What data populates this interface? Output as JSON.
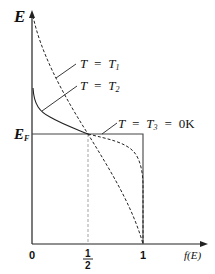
{
  "diagram": {
    "y_axis": {
      "label": "E",
      "fermi_level_label": "E",
      "fermi_level_subscript": "F"
    },
    "x_axis": {
      "label": "f(E)",
      "ticks": [
        {
          "label": "0"
        },
        {
          "numerator": "1",
          "denominator": "2"
        },
        {
          "label": "1"
        }
      ]
    },
    "curves": [
      {
        "label_T": "T",
        "label_eq": "=",
        "label_val": "T",
        "label_sub": "1",
        "style": "dashed"
      },
      {
        "label_T": "T",
        "label_eq": "=",
        "label_val": "T",
        "label_sub": "2",
        "style": "solid-then-dashed"
      },
      {
        "label_T": "T",
        "label_eq": "=",
        "label_val": "T",
        "label_sub": "3",
        "label_eq2": "=",
        "label_extra": "0K",
        "style": "solid-step"
      }
    ],
    "colors": {
      "line": "#222222",
      "guide": "#999999"
    }
  }
}
